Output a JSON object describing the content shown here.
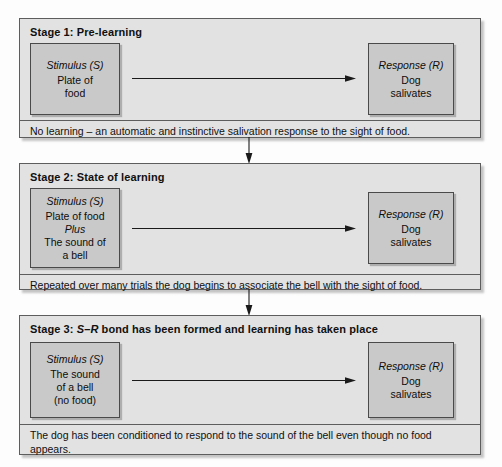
{
  "figure": {
    "stage_count": 3
  },
  "colors": {
    "panel_fill": "#e2e2e2",
    "panel_border": "#5d5d5d",
    "node_fill": "#c9c9c9",
    "node_border": "#4a4a4a",
    "arrow": "#1a1a1a",
    "text": "#101010",
    "page_background": "#fdfdfd"
  },
  "stages": [
    {
      "id": "stage-1",
      "title_prefix": "Stage 1: ",
      "title_emphasis": "",
      "title_suffix": "Pre-learning",
      "stimulus": {
        "head": "Stimulus (S)",
        "lines": [
          "Plate of",
          "food"
        ]
      },
      "response": {
        "head": "Response (R)",
        "lines": [
          "Dog",
          "salivates"
        ]
      },
      "arrow": "s-to-r-arrow",
      "caption": "No learning – an automatic and instinctive salivation response to the sight of food."
    },
    {
      "id": "stage-2",
      "title_prefix": "Stage 2: ",
      "title_emphasis": "",
      "title_suffix": "State of learning",
      "stimulus": {
        "head": "Stimulus (S)",
        "lines": [
          "Plate of food",
          "Plus",
          "The sound of",
          "a bell"
        ],
        "italic_line_index": 1
      },
      "response": {
        "head": "Response (R)",
        "lines": [
          "Dog",
          "salivates"
        ]
      },
      "arrow": "s-to-r-arrow",
      "caption": "Repeated over many trials the dog begins to associate the bell with the sight of food."
    },
    {
      "id": "stage-3",
      "title_prefix": "Stage 3: ",
      "title_emphasis": "S–R",
      "title_suffix": " bond has been formed and learning has taken place",
      "stimulus": {
        "head": "Stimulus (S)",
        "lines": [
          "The sound",
          "of a bell",
          "(no food)"
        ]
      },
      "response": {
        "head": "Response (R)",
        "lines": [
          "Dog",
          "salivates"
        ]
      },
      "arrow": "s-to-r-arrow",
      "caption": "The dog has been conditioned to respond to the sound of the bell even though no food appears."
    }
  ],
  "connectors": [
    {
      "id": "connector-1-to-2",
      "from": "stage-1",
      "to": "stage-2",
      "direction": "down"
    },
    {
      "id": "connector-2-to-3",
      "from": "stage-2",
      "to": "stage-3",
      "direction": "down"
    }
  ]
}
